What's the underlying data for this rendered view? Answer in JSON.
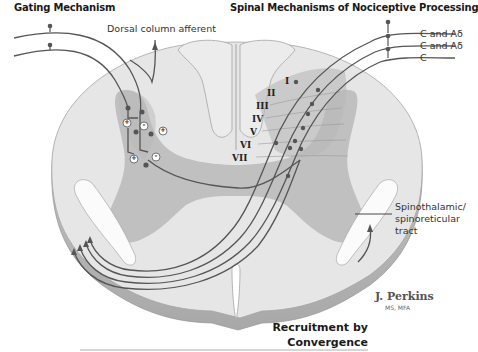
{
  "titles": {
    "left": "Gating Mechanism",
    "right": "Spinal Mechanisms of Nociceptive Processing"
  },
  "labels": {
    "dorsal_column": "Dorsal column afferent",
    "fiber_1": "C and Aδ",
    "fiber_2": "C and Aδ",
    "fiber_3": "C",
    "tract_line1": "Spinothalamic/",
    "tract_line2": "spinoreticular",
    "tract_line3": "tract"
  },
  "laminae": [
    "I",
    "II",
    "III",
    "IV",
    "V",
    "VI",
    "VII"
  ],
  "synapse_signs": [
    "+",
    "-",
    "+",
    "+",
    "-"
  ],
  "signature": {
    "name": "J. Perkins",
    "credentials": "MS, MFA"
  },
  "caption": {
    "line1": "Recruitment by",
    "line2": "Convergence"
  },
  "colors": {
    "white_matter": "#e4e4e4",
    "gray_matter": "#bdbdbd",
    "fiber": "#555555",
    "outline": "#9a9a9a"
  }
}
